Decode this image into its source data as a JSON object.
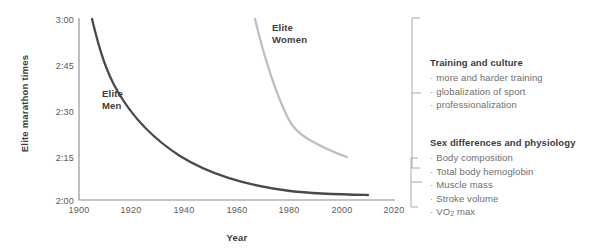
{
  "chart_data": {
    "type": "line",
    "title": "",
    "xlabel": "Year",
    "ylabel": "Elite marathon times",
    "xlim": [
      1900,
      2020
    ],
    "ylim_labels": [
      "2:00",
      "2:15",
      "2:30",
      "2:45",
      "3:00"
    ],
    "xticks": [
      1900,
      1920,
      1940,
      1960,
      1980,
      2000,
      2020
    ],
    "yticks": [
      "2:00",
      "2:15",
      "2:30",
      "2:45",
      "3:00"
    ],
    "grid": false,
    "legend_position": "inline-annotations",
    "series": [
      {
        "name": "Elite Men",
        "color": "#4a4a4a",
        "label_text": "Elite\nMen",
        "x": [
          1905,
          1910,
          1915,
          1920,
          1925,
          1930,
          1935,
          1940,
          1947,
          1953,
          1960,
          1967,
          1975,
          1985,
          1995,
          2005,
          2011
        ],
        "y": [
          "3:00",
          "2:51",
          "2:45",
          "2:40",
          "2:36",
          "2:32",
          "2:29",
          "2:26",
          "2:23",
          "2:20",
          "2:16",
          "2:13",
          "2:10",
          "2:08",
          "2:06",
          "2:04",
          "2:03"
        ]
      },
      {
        "name": "Elite Women",
        "color": "#bfbfbf",
        "label_text": "Elite\nWomen",
        "x": [
          1967,
          1969,
          1971,
          1973,
          1975,
          1977,
          1980,
          1985,
          1992,
          2000
        ],
        "y": [
          "3:07",
          "2:56",
          "2:45",
          "2:36",
          "2:30",
          "2:26",
          "2:24",
          "2:22",
          "2:19",
          "2:16"
        ]
      }
    ]
  },
  "annotations": {
    "groups": [
      {
        "heading": "Training and culture",
        "items": [
          "more and harder training",
          "globalization of sport",
          "professionalization"
        ]
      },
      {
        "heading": "Sex differences and physiology",
        "items": [
          "Body composition",
          "Total body hemoglobin",
          "Muscle mass",
          "Stroke volume",
          "VO2 max"
        ]
      }
    ],
    "bullet": "·"
  },
  "colors": {
    "men_line": "#4a4a4a",
    "women_line": "#bfbfbf",
    "axis": "#8c8c8c",
    "text": "#4d4d4d",
    "heading": "#3c3c3c"
  }
}
